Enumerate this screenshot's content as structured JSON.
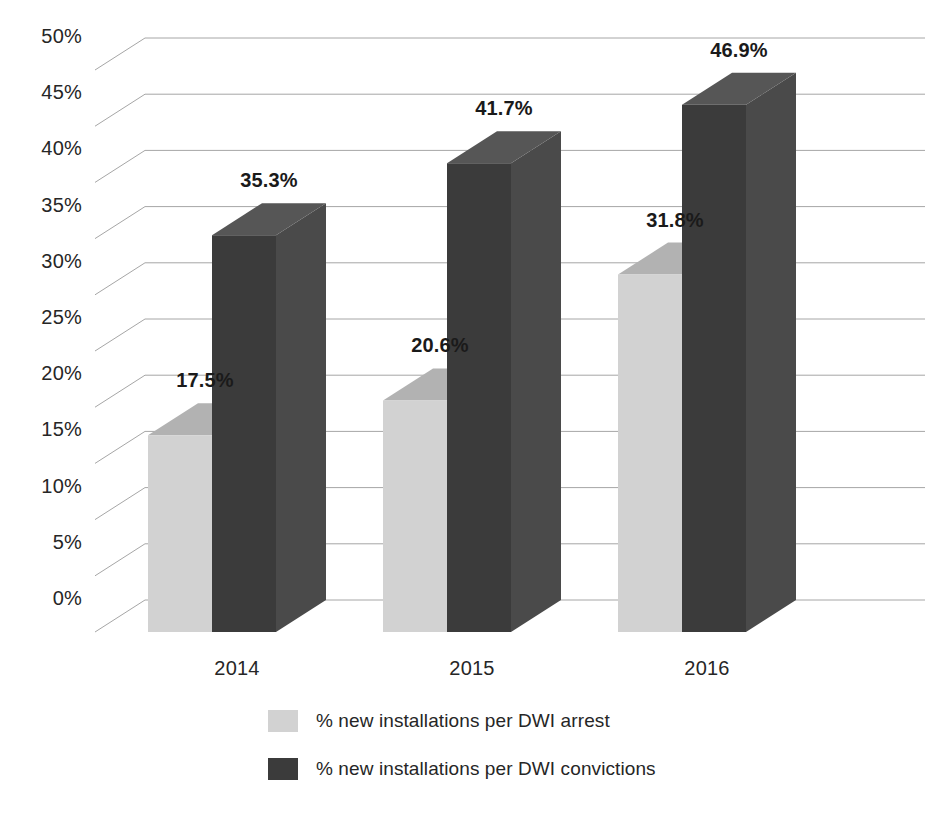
{
  "chart_data": {
    "type": "bar",
    "title": "",
    "subtitle": "",
    "xlabel": "",
    "ylabel": "",
    "categories": [
      "2014",
      "2015",
      "2016"
    ],
    "series": [
      {
        "name": "% new installations per DWI arrest",
        "color": "#d2d2d2",
        "top_color": "#b2b2b2",
        "side_color": "#bdbdbd",
        "values": [
          17.5,
          20.6,
          31.8
        ],
        "labels": [
          "17.5%",
          "20.6%",
          "31.8%"
        ]
      },
      {
        "name": "% new installations per DWI convictions",
        "color": "#3b3b3b",
        "top_color": "#565656",
        "side_color": "#4a4a4a",
        "values": [
          35.3,
          41.7,
          46.9
        ],
        "labels": [
          "35.3%",
          "41.7%",
          "46.9%"
        ]
      }
    ],
    "ylim": [
      0,
      50
    ],
    "ytick_values": [
      0,
      5,
      10,
      15,
      20,
      25,
      30,
      35,
      40,
      45,
      50
    ],
    "ytick_labels": [
      "0%",
      "5%",
      "10%",
      "15%",
      "20%",
      "25%",
      "30%",
      "35%",
      "40%",
      "45%",
      "50%"
    ],
    "grid": true,
    "grid_color": "#a6a6a6",
    "legend_position": "bottom",
    "projection": "3d-bar",
    "background": "#ffffff"
  },
  "legend": {
    "items": [
      {
        "label": "% new installations per DWI arrest",
        "swatch": "#d2d2d2"
      },
      {
        "label": "% new installations per DWI convictions",
        "swatch": "#3b3b3b"
      }
    ]
  },
  "axis": {
    "y_labels": [
      "50%",
      "45%",
      "40%",
      "35%",
      "30%",
      "25%",
      "20%",
      "15%",
      "10%",
      "5%",
      "0%"
    ],
    "x_labels": [
      "2014",
      "2015",
      "2016"
    ]
  },
  "data_labels": {
    "g0_light": "17.5%",
    "g0_dark": "35.3%",
    "g1_light": "20.6%",
    "g1_dark": "41.7%",
    "g2_light": "31.8%",
    "g2_dark": "46.9%"
  }
}
